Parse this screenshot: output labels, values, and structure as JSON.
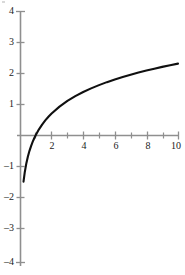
{
  "chart_data": {
    "type": "line",
    "title": "",
    "subtitle": "",
    "xlabel": "",
    "ylabel": "",
    "function": "ln(x)",
    "xlim": [
      0,
      10.35
    ],
    "ylim": [
      -4,
      4
    ],
    "grid": false,
    "legend": null,
    "axis_color": "#8f8f8f",
    "curve_color": "#101010",
    "background_color": "#ffffff",
    "x_major_ticks": [
      2,
      4,
      6,
      8,
      10
    ],
    "x_minor_ticks": [
      1,
      3,
      5,
      7,
      9
    ],
    "x_tick_labels": [
      "2",
      "4",
      "6",
      "8",
      "10"
    ],
    "y_major_ticks": [
      -4,
      -3,
      -2,
      -1,
      0,
      1,
      2,
      3,
      4
    ],
    "y_tick_labels": [
      "4",
      "3",
      "2",
      "1",
      "–1",
      "–2",
      "–3",
      "–4"
    ],
    "y_labeled_values": [
      4,
      3,
      2,
      1,
      -1,
      -2,
      -3,
      -4
    ],
    "x_axis_position": 0,
    "y_axis_position": 0,
    "series": [
      {
        "name": "ln(x)",
        "x": [
          0.222,
          0.3,
          0.4,
          0.5,
          0.6,
          0.7,
          0.8,
          0.9,
          1.0,
          1.2,
          1.4,
          1.6,
          1.8,
          2.0,
          2.5,
          3.0,
          3.5,
          4.0,
          4.5,
          5.0,
          5.5,
          6.0,
          6.5,
          7.0,
          7.5,
          8.0,
          8.5,
          9.0,
          9.5,
          10.0
        ],
        "values": [
          -1.505,
          -1.204,
          -0.916,
          -0.693,
          -0.511,
          -0.357,
          -0.223,
          -0.105,
          0.0,
          0.182,
          0.336,
          0.47,
          0.588,
          0.693,
          0.916,
          1.099,
          1.253,
          1.386,
          1.504,
          1.609,
          1.705,
          1.792,
          1.872,
          1.946,
          2.015,
          2.079,
          2.14,
          2.197,
          2.251,
          2.303
        ]
      }
    ],
    "annotations": []
  },
  "geometry": {
    "x_origin_px": 20,
    "y_origin_px": 135,
    "x_px_per_unit": 15.8,
    "y_px_per_unit": 31.0,
    "axis_top_px": 11,
    "axis_bottom_px": 266,
    "axis_right_px": 179
  }
}
